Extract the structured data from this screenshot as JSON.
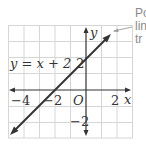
{
  "graph": {
    "equation_label": "y = x + 2",
    "axis_x_label": "x",
    "axis_y_label": "y",
    "origin_label": "O",
    "x_ticks": [
      {
        "value": -4,
        "label": "−4"
      },
      {
        "value": -2,
        "label": "−2"
      },
      {
        "value": 2,
        "label": "2"
      }
    ],
    "y_ticks": [
      {
        "value": 2,
        "label": "2"
      },
      {
        "value": -2,
        "label": "−2"
      }
    ],
    "grid_x_range": [
      -5,
      3
    ],
    "grid_y_range": [
      -3,
      4
    ],
    "line": {
      "slope": 1,
      "intercept": 2,
      "from": [
        -5,
        -3
      ],
      "to": [
        2.7,
        4.2
      ]
    },
    "colors": {
      "grid": "#d6d6d6",
      "axis": "#333333",
      "line": "#333333",
      "note": "#8a8a8a"
    }
  },
  "annotation": {
    "lines": [
      "Po",
      "lin",
      "tr"
    ]
  }
}
